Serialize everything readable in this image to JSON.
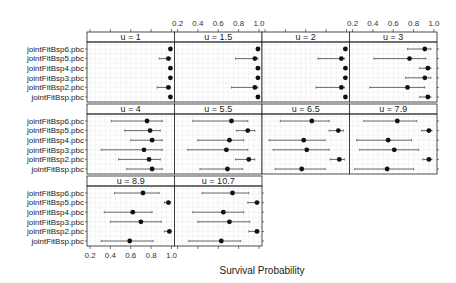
{
  "chart_data": {
    "type": "dotplot-errorbar",
    "title": "",
    "xlabel": "Survival Probability",
    "ylabel": "",
    "xlim": [
      0.17,
      1.03
    ],
    "x_ticks": [
      0.2,
      0.4,
      0.6,
      0.8,
      1.0
    ],
    "x_tick_labels": [
      "0.2",
      "0.4",
      "0.6",
      "0.8",
      "1.0"
    ],
    "grid": true,
    "layout": {
      "columns": 4,
      "rows": 3
    },
    "categories": [
      "jointFitBsp6.pbc",
      "jointFitBsp5.pbc",
      "jointFitBsp4.pbc",
      "jointFitBsp3.pbc",
      "jointFitBsp2.pbc",
      "jointFitBsp.pbc"
    ],
    "panels": [
      {
        "label": "u = 1",
        "est": [
          0.99,
          0.97,
          0.99,
          0.99,
          0.97,
          0.99
        ],
        "lower": [
          0.98,
          0.88,
          0.98,
          0.98,
          0.86,
          0.98
        ],
        "upper": [
          1.0,
          0.99,
          1.0,
          1.0,
          0.99,
          1.0
        ]
      },
      {
        "label": "u = 1.5",
        "est": [
          0.99,
          0.96,
          0.99,
          0.99,
          0.96,
          0.99
        ],
        "lower": [
          0.98,
          0.77,
          0.98,
          0.98,
          0.73,
          0.98
        ],
        "upper": [
          1.0,
          0.99,
          1.0,
          1.0,
          0.99,
          1.0
        ]
      },
      {
        "label": "u = 2",
        "est": [
          0.99,
          0.95,
          0.99,
          0.99,
          0.95,
          0.99
        ],
        "lower": [
          0.97,
          0.72,
          0.98,
          0.97,
          0.7,
          0.98
        ],
        "upper": [
          1.0,
          0.98,
          1.0,
          1.0,
          0.98,
          1.0
        ]
      },
      {
        "label": "u = 3",
        "est": [
          0.91,
          0.76,
          0.94,
          0.91,
          0.74,
          0.94
        ],
        "lower": [
          0.74,
          0.41,
          0.86,
          0.72,
          0.37,
          0.86
        ],
        "upper": [
          0.97,
          0.92,
          0.97,
          0.97,
          0.91,
          0.97
        ]
      },
      {
        "label": "u = 4",
        "est": [
          0.76,
          0.79,
          0.81,
          0.73,
          0.78,
          0.81
        ],
        "lower": [
          0.41,
          0.54,
          0.6,
          0.31,
          0.48,
          0.56
        ],
        "upper": [
          0.91,
          0.89,
          0.91,
          0.91,
          0.89,
          0.91
        ]
      },
      {
        "label": "u = 5.5",
        "est": [
          0.73,
          0.89,
          0.71,
          0.68,
          0.9,
          0.69
        ],
        "lower": [
          0.35,
          0.78,
          0.4,
          0.3,
          0.77,
          0.42
        ],
        "upper": [
          0.89,
          0.96,
          0.85,
          0.89,
          0.96,
          0.84
        ]
      },
      {
        "label": "u = 6.5",
        "est": [
          0.66,
          0.92,
          0.58,
          0.61,
          0.93,
          0.56
        ],
        "lower": [
          0.35,
          0.83,
          0.24,
          0.28,
          0.84,
          0.3
        ],
        "upper": [
          0.83,
          0.97,
          0.79,
          0.83,
          0.98,
          0.79
        ]
      },
      {
        "label": "u = 7.9",
        "est": [
          0.64,
          0.95,
          0.55,
          0.61,
          0.95,
          0.54
        ],
        "lower": [
          0.31,
          0.88,
          0.24,
          0.27,
          0.89,
          0.22
        ],
        "upper": [
          0.83,
          0.98,
          0.78,
          0.85,
          0.98,
          0.8
        ]
      },
      {
        "label": "u = 8.9",
        "est": [
          0.72,
          0.97,
          0.62,
          0.7,
          0.98,
          0.59
        ],
        "lower": [
          0.44,
          0.93,
          0.34,
          0.4,
          0.93,
          0.31
        ],
        "upper": [
          0.88,
          0.99,
          0.81,
          0.9,
          0.99,
          0.82
        ]
      },
      {
        "label": "u = 10.7",
        "est": [
          0.74,
          0.98,
          0.65,
          0.71,
          0.98,
          0.63
        ],
        "lower": [
          0.44,
          0.89,
          0.35,
          0.4,
          0.9,
          0.31
        ],
        "upper": [
          0.9,
          1.0,
          0.85,
          0.91,
          1.0,
          0.82
        ]
      }
    ]
  },
  "axis": {
    "title": "Survival Probability"
  }
}
